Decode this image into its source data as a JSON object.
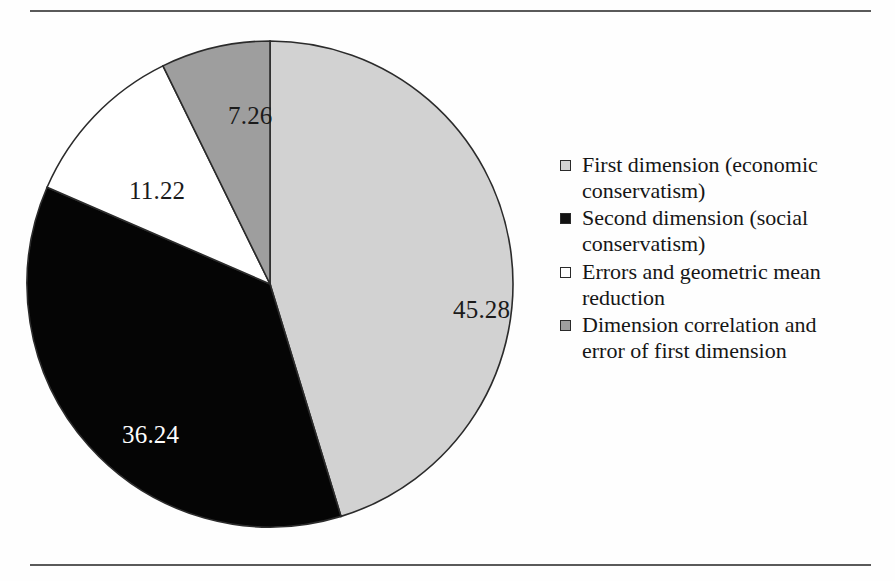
{
  "figure": {
    "background_color": "#fefefe",
    "rule_color": "#5a5a5a"
  },
  "chart_data": {
    "type": "pie",
    "title": "",
    "subtitle": "",
    "xlabel": "",
    "ylabel": "",
    "grid": false,
    "legend_position": "right",
    "start_angle_oclock": 12,
    "direction": "clockwise",
    "units": "percent",
    "categories": [
      "First dimension (economic conservatism)",
      "Second dimension (social conservatism)",
      "Errors and geometric mean reduction",
      "Dimension correlation and error of first dimension"
    ],
    "values": [
      45.28,
      36.24,
      11.22,
      7.26
    ],
    "data_labels": [
      "45.28",
      "36.24",
      "11.22",
      "7.26"
    ],
    "colors": [
      "#d2d2d2",
      "#050505",
      "#ffffff",
      "#9e9e9e"
    ],
    "slice_outline_color": "#2b2b2b",
    "label_text_colors": [
      "#1b1b1b",
      "#fdfdfd",
      "#1b1b1b",
      "#1b1b1b"
    ],
    "annotations": []
  },
  "legend": {
    "entries": [
      {
        "label": "First dimension (economic conservatism)",
        "swatch_color": "#d2d2d2",
        "swatch_name": "legend-swatch-first-dimension"
      },
      {
        "label": "Second dimension (social conservatism)",
        "swatch_color": "#121212",
        "swatch_name": "legend-swatch-second-dimension"
      },
      {
        "label": "Errors and geometric mean reduction",
        "swatch_color": "#ffffff",
        "swatch_name": "legend-swatch-errors"
      },
      {
        "label": "Dimension correlation and error of first dimension",
        "swatch_color": "#9e9e9e",
        "swatch_name": "legend-swatch-dimension-correlation"
      }
    ]
  }
}
